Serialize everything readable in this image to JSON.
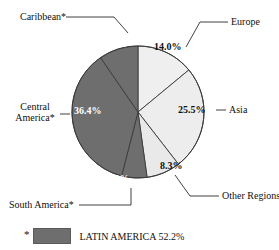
{
  "chart_data": {
    "type": "pie",
    "title": "",
    "categories": [
      "Europe",
      "Asia",
      "Other Regions",
      "South America*",
      "Central America*",
      "Caribbean*"
    ],
    "values": [
      14.0,
      25.5,
      8.3,
      6.2,
      36.4,
      9.6
    ],
    "value_labels": [
      "14.0%",
      "25.5%",
      "8.3%",
      "6.2%",
      "36.4%",
      "9.6%"
    ],
    "slice_colors": [
      "#efefef",
      "#ededed",
      "#e9e9e9",
      "#6e6e6e",
      "#6e6e6e",
      "#6e6e6e"
    ],
    "start_angle_deg": 0,
    "direction": "clockwise",
    "legend": {
      "position": "bottom-left",
      "star": "*",
      "swatch_color": "#6e6e6e",
      "text": "LATIN AMERICA 52.2%"
    },
    "xlabel": "",
    "ylabel": "",
    "grid": false
  },
  "labels": {
    "caribbean": "Caribbean*",
    "europe": "Europe",
    "asia": "Asia",
    "other_regions": "Other Regions",
    "central_america_line1": "Central",
    "central_america_line2": "America*",
    "south_america": "South America*"
  },
  "percents": {
    "caribbean": "9.6%",
    "europe": "14.0%",
    "asia": "25.5%",
    "other_regions": "8.3%",
    "central_america": "36.4%",
    "south_america": "6.2%"
  },
  "legend": {
    "star": "*",
    "text": "LATIN AMERICA 52.2%"
  }
}
